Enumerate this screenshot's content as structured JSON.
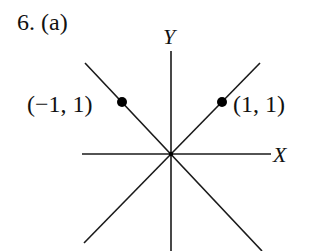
{
  "problem": {
    "number_label": "6. (a)"
  },
  "axes": {
    "x_label": "X",
    "y_label": "Y",
    "origin_px": [
      171,
      154
    ]
  },
  "points": [
    {
      "label": "(−1, 1)",
      "x": -1,
      "y": 1,
      "px": [
        122,
        102
      ]
    },
    {
      "label": "(1, 1)",
      "x": 1,
      "y": 1,
      "px": [
        222,
        102
      ]
    }
  ],
  "lines": [
    {
      "name": "x-axis",
      "from": [
        82,
        154
      ],
      "to": [
        271,
        154
      ]
    },
    {
      "name": "y-axis",
      "from": [
        171,
        51
      ],
      "to": [
        171,
        251
      ]
    },
    {
      "name": "line-y-equals-negative-x",
      "from": [
        85,
        63
      ],
      "to": [
        262,
        251
      ]
    },
    {
      "name": "line-y-equals-x",
      "from": [
        260,
        63
      ],
      "to": [
        84,
        243
      ]
    }
  ],
  "colors": {
    "stroke": "#1a1a1a",
    "point": "#000000",
    "background": "#ffffff"
  }
}
